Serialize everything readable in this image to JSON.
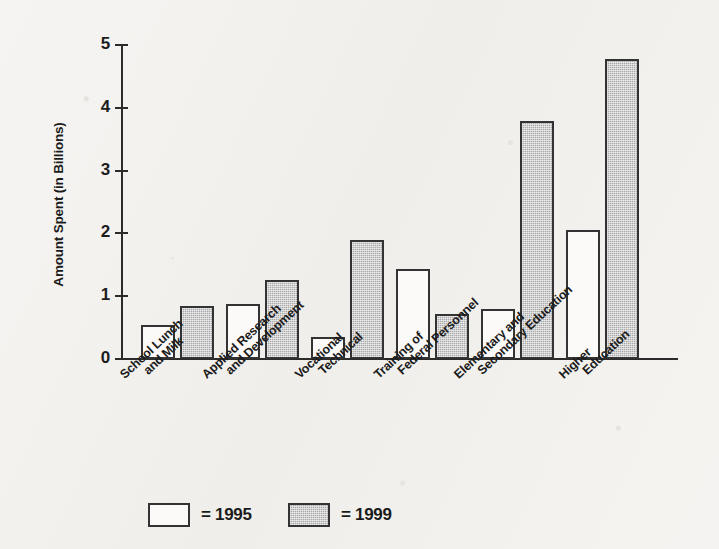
{
  "chart_data": {
    "type": "bar",
    "title": "",
    "xlabel": "",
    "ylabel": "Amount Spent (in Billions)",
    "ylim": [
      0,
      5
    ],
    "yticks": [
      0,
      1,
      2,
      3,
      4,
      5
    ],
    "ytick_labels": [
      "0",
      "1",
      "2",
      "3",
      "4",
      "5"
    ],
    "grid": false,
    "legend_position": "bottom",
    "categories": [
      "School Lunch and Milk",
      "Applied Research and Development",
      "Vocational Technical",
      "Training of Federal Personnel",
      "Elementary and Secondary Education",
      "Higher Education"
    ],
    "category_lines": [
      [
        "School Lunch",
        "and Milk"
      ],
      [
        "Applied Research",
        "and Development"
      ],
      [
        "Vocational",
        "Technical"
      ],
      [
        "Training of",
        "Federal Personnel"
      ],
      [
        "Elementary and",
        "Secondary Education"
      ],
      [
        "Higher",
        "Education"
      ]
    ],
    "series": [
      {
        "name": "1995",
        "color": "#fbfaf8",
        "values": [
          0.54,
          0.88,
          0.35,
          1.43,
          0.8,
          2.05
        ]
      },
      {
        "name": "1999",
        "color": "#a9a9a9",
        "values": [
          0.84,
          1.26,
          1.89,
          0.72,
          3.79,
          4.78
        ]
      }
    ]
  },
  "legend": {
    "items": [
      {
        "equals": "= 1995",
        "series": "1995"
      },
      {
        "equals": "= 1999",
        "series": "1999"
      }
    ]
  }
}
